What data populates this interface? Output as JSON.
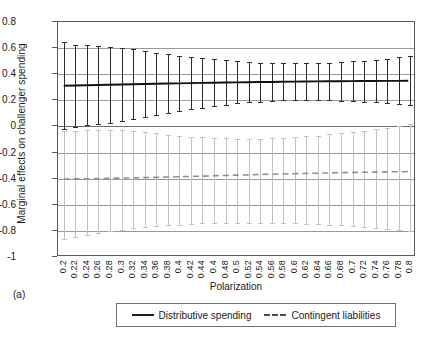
{
  "panel_label": "(a)",
  "chart_data": {
    "type": "line",
    "title": "",
    "xlabel": "Polarization",
    "ylabel": "Marginal effects on challenger spending",
    "xlim": [
      0.19,
      0.81
    ],
    "ylim": [
      -1,
      0.8
    ],
    "yticks": [
      0.8,
      0.6,
      0.4,
      0.2,
      0,
      -0.2,
      -0.4,
      -0.6,
      -0.8,
      -1
    ],
    "ytick_labels": [
      "0.8",
      "0.6",
      "0.4",
      "0.2",
      "0",
      "-0.2",
      "-0.4",
      "-0.6",
      "-0.8",
      "-1"
    ],
    "grid": true,
    "legend_position": "bottom",
    "x": [
      0.2,
      0.22,
      0.24,
      0.26,
      0.28,
      0.3,
      0.32,
      0.34,
      0.36,
      0.38,
      0.4,
      0.42,
      0.44,
      0.46,
      0.48,
      0.5,
      0.52,
      0.54,
      0.56,
      0.58,
      0.6,
      0.62,
      0.64,
      0.66,
      0.68,
      0.7,
      0.72,
      0.74,
      0.76,
      0.78,
      0.8
    ],
    "xtick_labels": [
      "0.2",
      "0.22",
      "0.24",
      "0.26",
      "0.28",
      "0.3",
      "0.32",
      "0.34",
      "0.36",
      "0.38",
      "0.4",
      "0.42",
      "0.44",
      "0.4",
      "0.48",
      "0.5",
      "0.52",
      "0.54",
      "0.56",
      "0.58",
      "0.6",
      "0.62",
      "0.64",
      "0.66",
      "0.68",
      "0.7",
      "0.72",
      "0.74",
      "0.76",
      "0.78",
      "0.8"
    ],
    "series": [
      {
        "name": "Distributive spending",
        "style": "solid",
        "color": "#2b2b2b",
        "values": [
          0.307,
          0.309,
          0.311,
          0.313,
          0.315,
          0.317,
          0.319,
          0.321,
          0.323,
          0.325,
          0.326,
          0.328,
          0.33,
          0.331,
          0.333,
          0.334,
          0.335,
          0.336,
          0.337,
          0.338,
          0.339,
          0.34,
          0.341,
          0.342,
          0.342,
          0.343,
          0.344,
          0.344,
          0.345,
          0.345,
          0.346
        ],
        "ci_upper": [
          0.645,
          0.628,
          0.623,
          0.618,
          0.611,
          0.601,
          0.59,
          0.578,
          0.566,
          0.554,
          0.543,
          0.533,
          0.523,
          0.514,
          0.506,
          0.499,
          0.494,
          0.49,
          0.487,
          0.485,
          0.484,
          0.485,
          0.487,
          0.49,
          0.494,
          0.499,
          0.505,
          0.512,
          0.52,
          0.529,
          0.539
        ],
        "ci_lower": [
          -0.031,
          -0.01,
          0.0,
          0.008,
          0.019,
          0.033,
          0.048,
          0.064,
          0.08,
          0.096,
          0.11,
          0.123,
          0.136,
          0.148,
          0.159,
          0.169,
          0.177,
          0.183,
          0.188,
          0.191,
          0.194,
          0.195,
          0.195,
          0.194,
          0.191,
          0.187,
          0.183,
          0.177,
          0.17,
          0.162,
          0.153
        ]
      },
      {
        "name": "Contingent liabilities",
        "style": "dashed",
        "color": "#c3c3c3",
        "values": [
          -0.413,
          -0.412,
          -0.411,
          -0.41,
          -0.408,
          -0.406,
          -0.404,
          -0.402,
          -0.4,
          -0.398,
          -0.396,
          -0.393,
          -0.391,
          -0.388,
          -0.386,
          -0.383,
          -0.381,
          -0.378,
          -0.376,
          -0.374,
          -0.372,
          -0.37,
          -0.368,
          -0.366,
          -0.364,
          -0.363,
          -0.361,
          -0.36,
          -0.358,
          -0.357,
          -0.356
        ],
        "ci_upper": [
          -0.038,
          -0.031,
          -0.027,
          -0.025,
          -0.026,
          -0.03,
          -0.036,
          -0.044,
          -0.053,
          -0.062,
          -0.07,
          -0.077,
          -0.083,
          -0.088,
          -0.091,
          -0.093,
          -0.094,
          -0.093,
          -0.091,
          -0.087,
          -0.082,
          -0.076,
          -0.069,
          -0.061,
          -0.052,
          -0.042,
          -0.031,
          -0.02,
          -0.008,
          0.005,
          0.019
        ],
        "ci_lower": [
          -0.872,
          -0.851,
          -0.836,
          -0.823,
          -0.811,
          -0.8,
          -0.79,
          -0.781,
          -0.773,
          -0.766,
          -0.76,
          -0.755,
          -0.751,
          -0.748,
          -0.746,
          -0.745,
          -0.744,
          -0.744,
          -0.745,
          -0.747,
          -0.749,
          -0.752,
          -0.756,
          -0.76,
          -0.765,
          -0.771,
          -0.777,
          -0.784,
          -0.791,
          -0.799,
          -0.808
        ]
      }
    ]
  },
  "legend": {
    "items": [
      {
        "label": "Distributive spending",
        "style": "solid"
      },
      {
        "label": "Contingent liabilities",
        "style": "dashed"
      }
    ]
  }
}
